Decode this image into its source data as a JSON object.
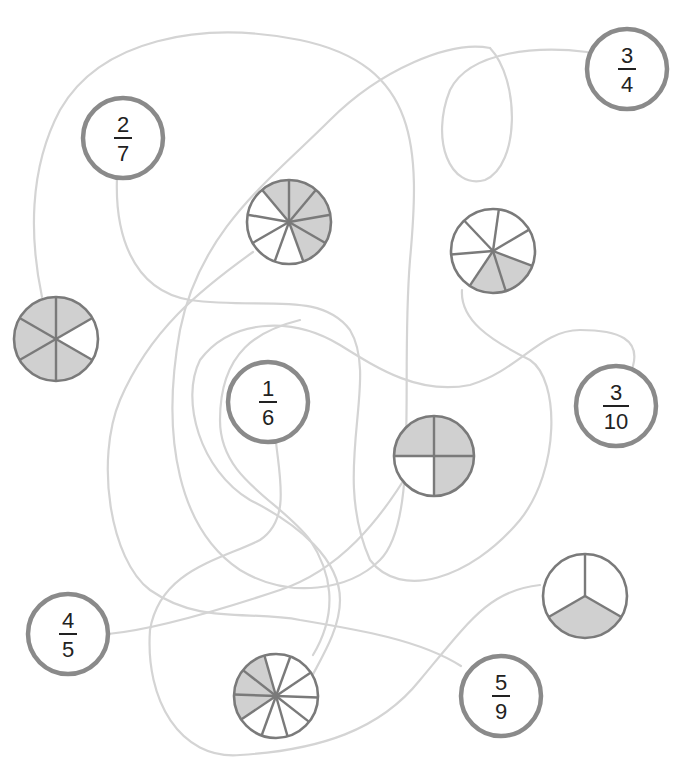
{
  "puzzle": {
    "title": "Match each fraction to its shaded circle",
    "colors": {
      "path": "#d4d4d4",
      "pie_outline": "#7a7a7a",
      "shaded": "#d0d0d0",
      "unshaded": "#ffffff",
      "fraction_ring": "#8a8a8a",
      "text": "#222222"
    },
    "fractions": [
      {
        "id": "f-2-7",
        "numerator": "2",
        "denominator": "7",
        "cx": 123,
        "cy": 138,
        "r": 40
      },
      {
        "id": "f-3-4",
        "numerator": "3",
        "denominator": "4",
        "cx": 627,
        "cy": 69,
        "r": 40
      },
      {
        "id": "f-1-6",
        "numerator": "1",
        "denominator": "6",
        "cx": 268,
        "cy": 402,
        "r": 40
      },
      {
        "id": "f-3-10",
        "numerator": "3",
        "denominator": "10",
        "cx": 616,
        "cy": 406,
        "r": 40
      },
      {
        "id": "f-4-5",
        "numerator": "4",
        "denominator": "5",
        "cx": 68,
        "cy": 634,
        "r": 40
      },
      {
        "id": "f-5-9",
        "numerator": "5",
        "denominator": "9",
        "cx": 501,
        "cy": 696,
        "r": 40
      }
    ],
    "pies": [
      {
        "id": "pie-9",
        "cx": 289,
        "cy": 222,
        "r": 42,
        "slices": 9,
        "shaded": 5,
        "start_deg": -90,
        "shade_start": -5
      },
      {
        "id": "pie-7",
        "cx": 493,
        "cy": 251,
        "r": 42,
        "slices": 7,
        "shaded": 2,
        "start_deg": -82,
        "shade_start": 4
      },
      {
        "id": "pie-6",
        "cx": 56,
        "cy": 339,
        "r": 42,
        "slices": 6,
        "shaded": 5,
        "start_deg": -90,
        "shade_start": 1
      },
      {
        "id": "pie-4",
        "cx": 434,
        "cy": 456,
        "r": 40,
        "slices": 4,
        "shaded": 3,
        "start_deg": -90,
        "shade_start": 2
      },
      {
        "id": "pie-3",
        "cx": 585,
        "cy": 596,
        "r": 42,
        "slices": 3,
        "shaded": 1,
        "start_deg": -90,
        "shade_start": 2
      },
      {
        "id": "pie-10",
        "cx": 276,
        "cy": 696,
        "r": 42,
        "slices": 10,
        "shaded": 3,
        "start_deg": -106,
        "shade_start": 0
      }
    ],
    "paths": [
      {
        "id": "path-a",
        "d": "M 42 297 C 30 240, 28 170, 60 110 C 100 40, 200 20, 300 40 C 420 65, 420 150, 410 260 C 400 380, 420 520, 380 560 C 350 590, 290 600, 240 570 C 180 530, 160 440, 180 330 C 200 230, 270 180, 330 120 C 380 70, 450 40, 490 48"
      },
      {
        "id": "path-b",
        "d": "M 587 52 C 540 46, 470 50, 450 90 C 430 140, 450 190, 485 180 C 520 165, 520 80, 490 48"
      },
      {
        "id": "path-c",
        "d": "M 117 178 C 115 230, 130 290, 190 300 C 260 310, 320 290, 350 330 C 380 380, 330 470, 370 560 C 400 600, 470 580, 520 520 C 560 470, 560 380, 530 360 C 490 340, 460 320, 462 290"
      },
      {
        "id": "path-d",
        "d": "M 253 252 C 200 290, 150 330, 120 400 C 95 460, 110 560, 150 590 C 200 625, 250 610, 300 620 C 360 630, 420 640, 461 666"
      },
      {
        "id": "path-e",
        "d": "M 108 634 C 150 630, 220 610, 280 590 C 340 570, 380 520, 410 470"
      },
      {
        "id": "path-f",
        "d": "M 276 442 C 280 480, 290 520, 260 540 C 220 560, 160 570, 150 630 C 145 700, 180 760, 240 755 C 320 750, 380 730, 420 680 C 470 620, 490 590, 540 585"
      },
      {
        "id": "path-g",
        "d": "M 633 366 C 640 340, 620 330, 580 330 C 540 330, 520 370, 470 385 C 420 395, 380 370, 340 345 C 290 315, 230 320, 200 360 C 180 400, 200 470, 250 500 C 300 525, 340 560, 340 600 C 340 630, 320 660, 310 680"
      },
      {
        "id": "path-h",
        "d": "M 313 655 C 340 610, 330 570, 310 540 C 280 500, 220 480, 220 420 C 220 350, 260 330, 300 320"
      }
    ]
  }
}
